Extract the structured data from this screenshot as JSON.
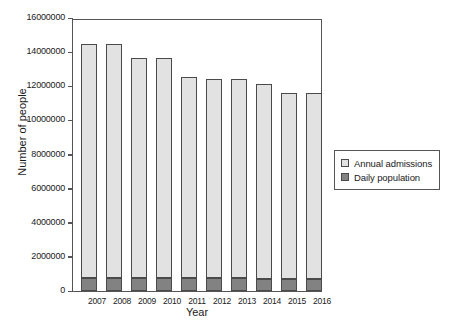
{
  "chart_data": {
    "type": "bar",
    "subtype": "stacked-vertical",
    "title": "",
    "xlabel": "Year",
    "ylabel": "Number of people",
    "categories": [
      "2007",
      "2008",
      "2009",
      "2010",
      "2011",
      "2012",
      "2013",
      "2014",
      "2015",
      "2016"
    ],
    "ylim": [
      0,
      16000000
    ],
    "ytick_step": 2000000,
    "ytick_labels": [
      "16000000",
      "14000000",
      "12000000",
      "10000000",
      "8000000",
      "6000000",
      "4000000",
      "2000000",
      "0"
    ],
    "ytick_values": [
      16000000,
      14000000,
      12000000,
      10000000,
      8000000,
      6000000,
      4000000,
      2000000,
      0
    ],
    "grid": false,
    "legend_position": "right",
    "series": [
      {
        "name": "Annual admissions",
        "color": "#e2e2e2",
        "values": [
          14500000,
          14500000,
          13650000,
          13650000,
          12550000,
          12400000,
          12400000,
          12150000,
          11600000,
          11600000
        ]
      },
      {
        "name": "Daily population",
        "color": "#828282",
        "values": [
          760000,
          760000,
          760000,
          740000,
          740000,
          740000,
          740000,
          720000,
          700000,
          700000
        ]
      }
    ],
    "stack_totals": [
      14500000,
      14500000,
      13650000,
      13650000,
      12550000,
      12400000,
      12400000,
      12150000,
      11600000,
      11600000
    ]
  },
  "legend": {
    "items": [
      {
        "label": "Annual admissions",
        "swatch": "admissions"
      },
      {
        "label": "Daily population",
        "swatch": "daily"
      }
    ]
  }
}
